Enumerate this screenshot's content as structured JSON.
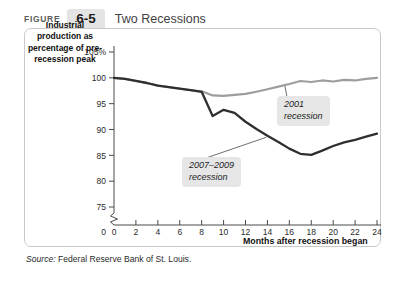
{
  "header": {
    "figure_word": "FIGURE",
    "figure_number": "6-5",
    "title": "Two Recessions"
  },
  "axis_caption": "Industrial production as percentage of pre-recession peak",
  "x_axis_title": "Months after recession began",
  "source": {
    "label": "Source:",
    "text": "Federal Reserve Bank of St. Louis."
  },
  "annotations": {
    "a2001_line1": "2001",
    "a2001_line2": "recession",
    "a2007_line1": "2007–2009",
    "a2007_line2": "recession"
  },
  "chart_data": {
    "type": "line",
    "title": "Two Recessions",
    "xlabel": "Months after recession began",
    "ylabel": "Industrial production as percentage of pre-recession peak",
    "xlim": [
      0,
      24
    ],
    "ylim": [
      75,
      105
    ],
    "xticks": [
      0,
      2,
      4,
      6,
      8,
      10,
      12,
      14,
      16,
      18,
      20,
      22,
      24
    ],
    "xtick_labels": [
      "0",
      "2",
      "4",
      "6",
      "8",
      "10",
      "12",
      "14",
      "16",
      "18",
      "20",
      "22",
      "24"
    ],
    "yticks": [
      75,
      80,
      85,
      90,
      95,
      100,
      105
    ],
    "ytick_labels": [
      "75",
      "80",
      "85",
      "90",
      "95",
      "100",
      "105%"
    ],
    "y_axis_break": true,
    "y_axis_origin_label": "0",
    "grid": false,
    "legend": "annotations",
    "series": [
      {
        "name": "2001 recession",
        "color": "#9d9d9d",
        "x": [
          0,
          1,
          2,
          3,
          4,
          5,
          6,
          7,
          8,
          9,
          10,
          11,
          12,
          13,
          14,
          15,
          16,
          17,
          18,
          19,
          20,
          21,
          22,
          23,
          24
        ],
        "values": [
          100.0,
          99.8,
          99.4,
          99.0,
          98.5,
          98.2,
          97.9,
          97.6,
          97.4,
          96.6,
          96.5,
          96.7,
          96.9,
          97.3,
          97.8,
          98.3,
          98.8,
          99.4,
          99.2,
          99.5,
          99.3,
          99.6,
          99.5,
          99.8,
          100.0
        ]
      },
      {
        "name": "2007-2009 recession",
        "color": "#2f2f2f",
        "x": [
          0,
          1,
          2,
          3,
          4,
          5,
          6,
          7,
          8,
          9,
          10,
          11,
          12,
          13,
          14,
          15,
          16,
          17,
          18,
          19,
          20,
          21,
          22,
          23,
          24
        ],
        "values": [
          100.0,
          99.8,
          99.4,
          99.0,
          98.5,
          98.2,
          97.9,
          97.6,
          97.3,
          92.6,
          93.8,
          93.2,
          91.5,
          90.1,
          88.8,
          87.6,
          86.3,
          85.3,
          85.1,
          85.9,
          86.8,
          87.5,
          88.0,
          88.6,
          89.2
        ]
      }
    ]
  }
}
